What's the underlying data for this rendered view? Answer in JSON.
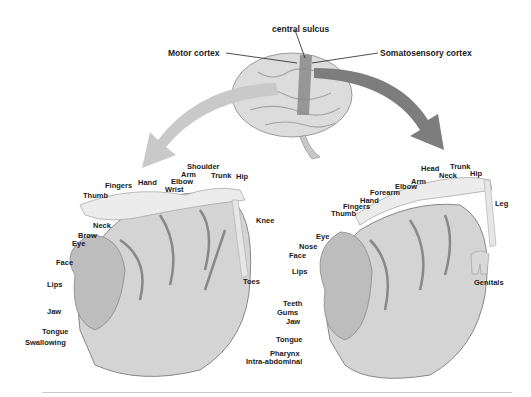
{
  "title_labels": {
    "central_sulcus": "central sulcus",
    "motor_cortex": "Motor cortex",
    "somatosensory_cortex": "Somatosensory cortex"
  },
  "colors": {
    "motor_arrow": "#c9c9c9",
    "sensory_arrow": "#7d7d7d",
    "central_strip": "#8a8a8a",
    "label_text": "#1a1a1a"
  },
  "motor_homunculus": {
    "labels": [
      "Shoulder",
      "Arm",
      "Elbow",
      "Wrist",
      "Hand",
      "Fingers",
      "Thumb",
      "Trunk",
      "Hip",
      "Knee",
      "Toes",
      "Neck",
      "Brow",
      "Eye",
      "Face",
      "Lips",
      "Jaw",
      "Tongue",
      "Swallowing"
    ]
  },
  "sensory_homunculus": {
    "labels": [
      "Head",
      "Trunk",
      "Hip",
      "Neck",
      "Arm",
      "Elbow",
      "Forearm",
      "Hand",
      "Fingers",
      "Thumb",
      "Leg",
      "Eye",
      "Nose",
      "Face",
      "Lips",
      "Teeth",
      "Gums",
      "Jaw",
      "Tongue",
      "Pharynx",
      "Intra-abdominal",
      "Genitals"
    ]
  }
}
